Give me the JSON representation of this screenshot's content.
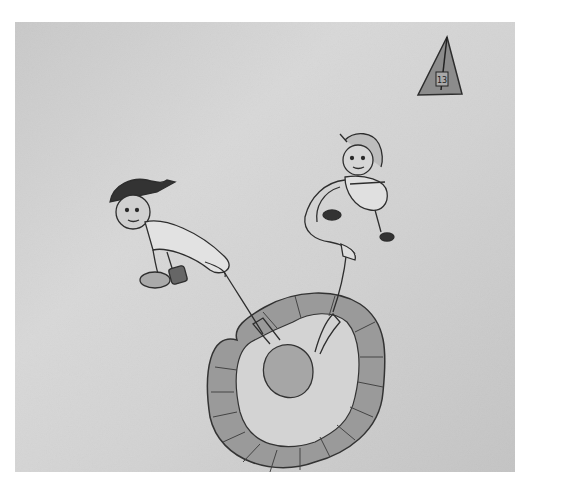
{
  "image": {
    "description": "Photograph of a child's pencil drawing on gray paper",
    "subjects": [
      "boy-with-cap-figure",
      "girl-with-hair-figure",
      "oval-ring-track",
      "center-ball",
      "triangle-flag"
    ],
    "flag_label": "13",
    "colors": {
      "paper": "#d2d2d2",
      "margin": "#ffffff",
      "pencil": "#3a3a3a",
      "shading": "#9a9a9a"
    }
  },
  "caption_fragment": "····"
}
